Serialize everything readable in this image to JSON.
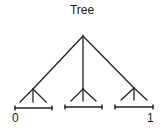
{
  "title": "Tree",
  "colors": {
    "stroke": "#222222",
    "text": "#1a1a1a",
    "background": "#ffffff"
  },
  "root": {
    "x": 83,
    "y": 36
  },
  "children": [
    {
      "name": "left",
      "node": {
        "x": 33,
        "y": 89
      },
      "leaves": [
        {
          "x": 20,
          "y": 102
        },
        {
          "x": 33,
          "y": 102
        },
        {
          "x": 46,
          "y": 102
        }
      ],
      "interval": {
        "x1": 15,
        "x2": 52,
        "y": 108
      }
    },
    {
      "name": "middle",
      "node": {
        "x": 83,
        "y": 89
      },
      "leaves": [
        {
          "x": 71,
          "y": 101
        },
        {
          "x": 83,
          "y": 101
        },
        {
          "x": 96,
          "y": 101
        }
      ],
      "interval": {
        "x1": 65,
        "x2": 102,
        "y": 107
      }
    },
    {
      "name": "right",
      "node": {
        "x": 134,
        "y": 88
      },
      "leaves": [
        {
          "x": 121,
          "y": 100
        },
        {
          "x": 134,
          "y": 100
        },
        {
          "x": 147,
          "y": 100
        }
      ],
      "interval": {
        "x1": 115,
        "x2": 153,
        "y": 107
      }
    }
  ],
  "axis_labels": [
    {
      "text": "0",
      "x": 12,
      "y": 112
    },
    {
      "text": "1",
      "x": 147,
      "y": 112
    }
  ]
}
